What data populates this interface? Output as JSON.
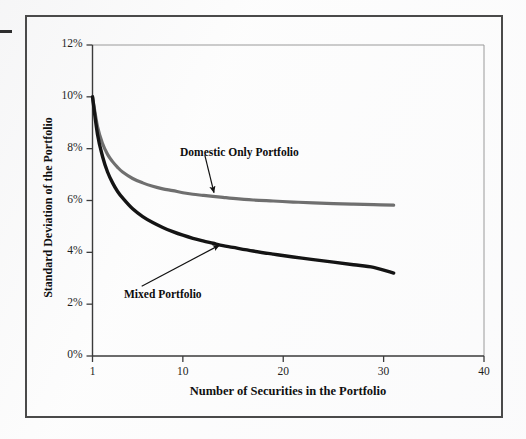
{
  "figure": {
    "frame_color": "#4a4a4a",
    "background": "#fdfdfd",
    "margin_dash": "margin-dash"
  },
  "chart_data": {
    "type": "line",
    "title": "",
    "xlabel": "Number of Securities in the Portfolio",
    "ylabel": "Standard Deviation of the Portfolio",
    "xlim": [
      1,
      40
    ],
    "ylim": [
      0,
      12
    ],
    "grid": false,
    "legend_position": "inline-annotations",
    "x_ticks": [
      "1",
      "10",
      "20",
      "30",
      "40"
    ],
    "x_tick_values": [
      1,
      10,
      20,
      30,
      40
    ],
    "y_ticks": [
      "0%",
      "2%",
      "4%",
      "6%",
      "8%",
      "10%",
      "12%"
    ],
    "y_tick_values": [
      0,
      2,
      4,
      6,
      8,
      10,
      12
    ],
    "series": [
      {
        "name": "Domestic Only Portfolio",
        "color": "#6f6f6f",
        "width": 3.2,
        "x": [
          1,
          1.5,
          2,
          2.5,
          3,
          3.5,
          4,
          5,
          6,
          7,
          8,
          9,
          10,
          11,
          12,
          13,
          14,
          15,
          17,
          19,
          21,
          23,
          25,
          27,
          29,
          31
        ],
        "y": [
          10.0,
          8.85,
          8.2,
          7.78,
          7.5,
          7.28,
          7.1,
          6.85,
          6.68,
          6.55,
          6.45,
          6.38,
          6.3,
          6.24,
          6.2,
          6.16,
          6.12,
          6.08,
          6.02,
          5.98,
          5.94,
          5.91,
          5.88,
          5.86,
          5.84,
          5.82
        ]
      },
      {
        "name": "Mixed Portfolio",
        "color": "#141414",
        "width": 3.4,
        "x": [
          1,
          1.5,
          2,
          2.5,
          3,
          3.5,
          4,
          5,
          6,
          7,
          8,
          9,
          10,
          11,
          12,
          13,
          14,
          15,
          17,
          19,
          21,
          23,
          25,
          27,
          29,
          31
        ],
        "y": [
          10.0,
          8.55,
          7.7,
          7.1,
          6.68,
          6.35,
          6.1,
          5.68,
          5.38,
          5.15,
          4.96,
          4.8,
          4.66,
          4.54,
          4.44,
          4.35,
          4.26,
          4.19,
          4.05,
          3.93,
          3.82,
          3.72,
          3.62,
          3.52,
          3.42,
          3.2
        ]
      }
    ],
    "annotations": [
      {
        "text": "Domestic Only Portfolio",
        "label_x": 12.0,
        "label_y": 8.05,
        "point_x": 13.2,
        "point_y": 6.15
      },
      {
        "text": "Mixed Portfolio",
        "label_x": 5.2,
        "label_y": 2.55,
        "point_x": 14.0,
        "point_y": 4.35
      }
    ]
  }
}
